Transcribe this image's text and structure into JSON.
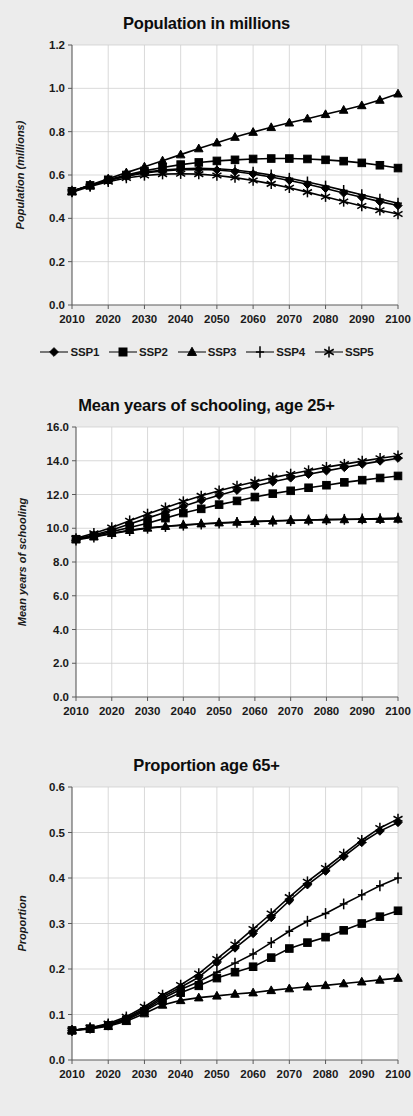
{
  "figure": {
    "background_color": "#ececec",
    "plot_background_color": "#ffffff",
    "series_color": "#000000",
    "grid_color": "#cfcfcf"
  },
  "legend": {
    "position": "below-first-chart",
    "items": [
      {
        "label": "SSP1",
        "marker": "diamond-marker"
      },
      {
        "label": "SSP2",
        "marker": "square-marker"
      },
      {
        "label": "SSP3",
        "marker": "triangle-marker"
      },
      {
        "label": "SSP4",
        "marker": "plus-marker"
      },
      {
        "label": "SSP5",
        "marker": "asterisk-marker"
      }
    ]
  },
  "chart_data": [
    {
      "id": "population",
      "type": "line",
      "title": "Population in millions",
      "xlabel": "",
      "ylabel": "Population (millions)",
      "xlim": [
        2010,
        2100
      ],
      "ylim": [
        0.0,
        1.2
      ],
      "ytick_step": 0.2,
      "grid": true,
      "legend_position": "bottom",
      "xticks": [
        2010,
        2020,
        2030,
        2040,
        2050,
        2060,
        2070,
        2080,
        2090,
        2100
      ],
      "ytick_labels": [
        "0.0",
        "0.2",
        "0.4",
        "0.6",
        "0.8",
        "1.0",
        "1.2"
      ],
      "x": [
        2010,
        2015,
        2020,
        2025,
        2030,
        2035,
        2040,
        2045,
        2050,
        2055,
        2060,
        2065,
        2070,
        2075,
        2080,
        2085,
        2090,
        2095,
        2100
      ],
      "series": [
        {
          "name": "SSP1",
          "marker": "diamond-marker",
          "values": [
            0.525,
            0.551,
            0.575,
            0.594,
            0.609,
            0.619,
            0.625,
            0.626,
            0.623,
            0.616,
            0.605,
            0.591,
            0.575,
            0.557,
            0.538,
            0.517,
            0.497,
            0.477,
            0.459
          ]
        },
        {
          "name": "SSP2",
          "marker": "square-marker",
          "values": [
            0.525,
            0.552,
            0.578,
            0.6,
            0.619,
            0.635,
            0.648,
            0.658,
            0.665,
            0.67,
            0.674,
            0.676,
            0.676,
            0.674,
            0.67,
            0.664,
            0.656,
            0.645,
            0.632
          ]
        },
        {
          "name": "SSP3",
          "marker": "triangle-marker",
          "values": [
            0.525,
            0.554,
            0.583,
            0.611,
            0.638,
            0.666,
            0.694,
            0.722,
            0.749,
            0.775,
            0.798,
            0.82,
            0.841,
            0.86,
            0.88,
            0.9,
            0.921,
            0.946,
            0.975
          ]
        },
        {
          "name": "SSP4",
          "marker": "plus-marker",
          "values": [
            0.525,
            0.551,
            0.576,
            0.596,
            0.612,
            0.623,
            0.629,
            0.631,
            0.629,
            0.623,
            0.613,
            0.6,
            0.585,
            0.568,
            0.549,
            0.529,
            0.509,
            0.489,
            0.47
          ]
        },
        {
          "name": "SSP5",
          "marker": "asterisk-marker",
          "values": [
            0.521,
            0.547,
            0.569,
            0.586,
            0.598,
            0.604,
            0.606,
            0.604,
            0.598,
            0.588,
            0.575,
            0.559,
            0.541,
            0.521,
            0.5,
            0.478,
            0.457,
            0.437,
            0.42
          ]
        }
      ]
    },
    {
      "id": "schooling",
      "type": "line",
      "title": "Mean years of schooling, age 25+",
      "xlabel": "",
      "ylabel": "Mean years of schooling",
      "xlim": [
        2010,
        2100
      ],
      "ylim": [
        0.0,
        16.0
      ],
      "ytick_step": 2.0,
      "grid": true,
      "legend_position": "shared",
      "xticks": [
        2010,
        2020,
        2030,
        2040,
        2050,
        2060,
        2070,
        2080,
        2090,
        2100
      ],
      "ytick_labels": [
        "0.0",
        "2.0",
        "4.0",
        "6.0",
        "8.0",
        "10.0",
        "12.0",
        "14.0",
        "16.0"
      ],
      "x": [
        2010,
        2015,
        2020,
        2025,
        2030,
        2035,
        2040,
        2045,
        2050,
        2055,
        2060,
        2065,
        2070,
        2075,
        2080,
        2085,
        2090,
        2095,
        2100
      ],
      "series": [
        {
          "name": "SSP1",
          "marker": "diamond-marker",
          "values": [
            9.35,
            9.6,
            9.9,
            10.25,
            10.6,
            10.95,
            11.3,
            11.65,
            11.95,
            12.25,
            12.5,
            12.75,
            12.98,
            13.2,
            13.4,
            13.6,
            13.8,
            13.98,
            14.15
          ]
        },
        {
          "name": "SSP2",
          "marker": "square-marker",
          "values": [
            9.35,
            9.55,
            9.8,
            10.05,
            10.3,
            10.6,
            10.9,
            11.15,
            11.4,
            11.62,
            11.85,
            12.05,
            12.22,
            12.4,
            12.55,
            12.72,
            12.85,
            12.98,
            13.1
          ]
        },
        {
          "name": "SSP3",
          "marker": "triangle-marker",
          "values": [
            9.35,
            9.5,
            9.7,
            9.88,
            10.02,
            10.12,
            10.2,
            10.27,
            10.33,
            10.37,
            10.41,
            10.44,
            10.47,
            10.49,
            10.51,
            10.52,
            10.53,
            10.54,
            10.55
          ]
        },
        {
          "name": "SSP4",
          "marker": "plus-marker",
          "values": [
            9.3,
            9.48,
            9.68,
            9.86,
            10.0,
            10.1,
            10.18,
            10.25,
            10.3,
            10.35,
            10.39,
            10.43,
            10.46,
            10.49,
            10.51,
            10.53,
            10.55,
            10.57,
            10.6
          ]
        },
        {
          "name": "SSP5",
          "marker": "asterisk-marker",
          "values": [
            9.4,
            9.7,
            10.05,
            10.45,
            10.85,
            11.22,
            11.58,
            11.92,
            12.22,
            12.5,
            12.75,
            13.0,
            13.22,
            13.42,
            13.62,
            13.8,
            13.98,
            14.15,
            14.3
          ]
        }
      ]
    },
    {
      "id": "aged65",
      "type": "line",
      "title": "Proportion age 65+",
      "xlabel": "",
      "ylabel": "Proportion",
      "xlim": [
        2010,
        2100
      ],
      "ylim": [
        0.0,
        0.6
      ],
      "ytick_step": 0.1,
      "grid": true,
      "legend_position": "shared",
      "xticks": [
        2010,
        2020,
        2030,
        2040,
        2050,
        2060,
        2070,
        2080,
        2090,
        2100
      ],
      "ytick_labels": [
        "0.0",
        "0.1",
        "0.2",
        "0.3",
        "0.4",
        "0.5",
        "0.6"
      ],
      "x": [
        2010,
        2015,
        2020,
        2025,
        2030,
        2035,
        2040,
        2045,
        2050,
        2055,
        2060,
        2065,
        2070,
        2075,
        2080,
        2085,
        2090,
        2095,
        2100
      ],
      "series": [
        {
          "name": "SSP1",
          "marker": "diamond-marker",
          "values": [
            0.065,
            0.07,
            0.078,
            0.092,
            0.113,
            0.139,
            0.16,
            0.182,
            0.214,
            0.246,
            0.278,
            0.313,
            0.35,
            0.385,
            0.415,
            0.447,
            0.478,
            0.503,
            0.522
          ]
        },
        {
          "name": "SSP2",
          "marker": "square-marker",
          "values": [
            0.065,
            0.069,
            0.076,
            0.088,
            0.107,
            0.13,
            0.148,
            0.163,
            0.18,
            0.193,
            0.205,
            0.225,
            0.245,
            0.258,
            0.27,
            0.285,
            0.3,
            0.315,
            0.328
          ]
        },
        {
          "name": "SSP3",
          "marker": "triangle-marker",
          "values": [
            0.065,
            0.068,
            0.074,
            0.085,
            0.102,
            0.121,
            0.131,
            0.137,
            0.141,
            0.145,
            0.148,
            0.153,
            0.157,
            0.161,
            0.164,
            0.168,
            0.172,
            0.176,
            0.18
          ]
        },
        {
          "name": "SSP4",
          "marker": "plus-marker",
          "values": [
            0.065,
            0.07,
            0.077,
            0.09,
            0.11,
            0.135,
            0.155,
            0.172,
            0.193,
            0.213,
            0.233,
            0.258,
            0.283,
            0.305,
            0.322,
            0.343,
            0.363,
            0.383,
            0.4
          ]
        },
        {
          "name": "SSP5",
          "marker": "asterisk-marker",
          "values": [
            0.065,
            0.071,
            0.08,
            0.095,
            0.117,
            0.143,
            0.165,
            0.19,
            0.222,
            0.254,
            0.288,
            0.322,
            0.358,
            0.392,
            0.422,
            0.453,
            0.483,
            0.51,
            0.53
          ]
        }
      ]
    }
  ]
}
